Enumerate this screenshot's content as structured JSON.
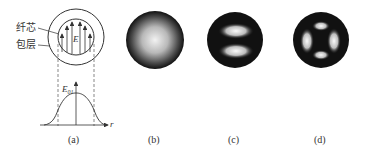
{
  "figure": {
    "panel_a": {
      "label_core": "纤芯",
      "label_cladding": "包层",
      "field_symbol": "E",
      "profile_symbol": "E",
      "profile_subscript": "01",
      "axis_label": "r",
      "caption": "(a)"
    },
    "panel_b": {
      "caption": "(b)",
      "pattern": "single central bright spot (LP01)"
    },
    "panel_c": {
      "caption": "(c)",
      "pattern": "two lobes stacked vertically (LP11)"
    },
    "panel_d": {
      "caption": "(d)",
      "pattern": "four lobes (LP21)"
    }
  }
}
